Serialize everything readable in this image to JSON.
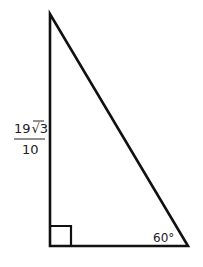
{
  "diagram": {
    "type": "right-triangle",
    "side_label": {
      "numerator": "19",
      "radical": "3",
      "denominator": "10",
      "text": "19√3/10"
    },
    "angle_label": "60°",
    "right_angle_marker": true,
    "colors": {
      "stroke": "#111111",
      "background": "#ffffff"
    }
  }
}
